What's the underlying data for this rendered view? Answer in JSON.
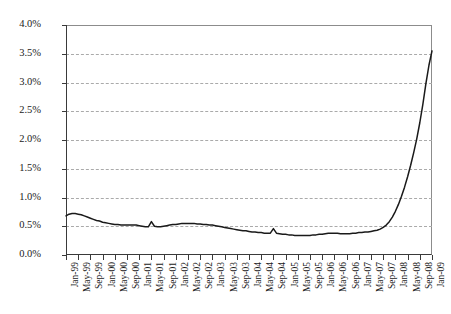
{
  "chart_data": {
    "type": "line",
    "title": "",
    "xlabel": "",
    "ylabel": "Percent Noncurrent (60+ days)",
    "ylim": [
      0,
      4.0
    ],
    "ytick_labels": [
      "0.0%",
      "0.5%",
      "1.0%",
      "1.5%",
      "2.0%",
      "2.5%",
      "3.0%",
      "3.5%",
      "4.0%"
    ],
    "ytick_values": [
      0.0,
      0.5,
      1.0,
      1.5,
      2.0,
      2.5,
      3.0,
      3.5,
      4.0
    ],
    "grid": true,
    "legend": "none",
    "units": "percent",
    "x_tick_labels": [
      "Jan-99",
      "May-99",
      "Sep-99",
      "Jan-00",
      "May-00",
      "Sep-00",
      "Jan-01",
      "May-01",
      "Sep-01",
      "Jan-02",
      "May-02",
      "Sep-02",
      "Jan-03",
      "May-03",
      "Sep-03",
      "Jan-04",
      "May-04",
      "Sep-04",
      "Jan-05",
      "May-05",
      "Sep-05",
      "Jan-06",
      "May-06",
      "Sep-06",
      "Jan-07",
      "May-07",
      "Sep-07",
      "Jan-08",
      "May-08",
      "Sep-08",
      "Jan-09"
    ],
    "x": [
      "Jan-99",
      "Feb-99",
      "Mar-99",
      "Apr-99",
      "May-99",
      "Jun-99",
      "Jul-99",
      "Aug-99",
      "Sep-99",
      "Oct-99",
      "Nov-99",
      "Dec-99",
      "Jan-00",
      "Feb-00",
      "Mar-00",
      "Apr-00",
      "May-00",
      "Jun-00",
      "Jul-00",
      "Aug-00",
      "Sep-00",
      "Oct-00",
      "Nov-00",
      "Dec-00",
      "Jan-01",
      "Feb-01",
      "Mar-01",
      "Apr-01",
      "May-01",
      "Jun-01",
      "Jul-01",
      "Aug-01",
      "Sep-01",
      "Oct-01",
      "Nov-01",
      "Dec-01",
      "Jan-02",
      "Feb-02",
      "Mar-02",
      "Apr-02",
      "May-02",
      "Jun-02",
      "Jul-02",
      "Aug-02",
      "Sep-02",
      "Oct-02",
      "Nov-02",
      "Dec-02",
      "Jan-03",
      "Feb-03",
      "Mar-03",
      "Apr-03",
      "May-03",
      "Jun-03",
      "Jul-03",
      "Aug-03",
      "Sep-03",
      "Oct-03",
      "Nov-03",
      "Dec-03",
      "Jan-04",
      "Feb-04",
      "Mar-04",
      "Apr-04",
      "May-04",
      "Jun-04",
      "Jul-04",
      "Aug-04",
      "Sep-04",
      "Oct-04",
      "Nov-04",
      "Dec-04",
      "Jan-05",
      "Feb-05",
      "Mar-05",
      "Apr-05",
      "May-05",
      "Jun-05",
      "Jul-05",
      "Aug-05",
      "Sep-05",
      "Oct-05",
      "Nov-05",
      "Dec-05",
      "Jan-06",
      "Feb-06",
      "Mar-06",
      "Apr-06",
      "May-06",
      "Jun-06",
      "Jul-06",
      "Aug-06",
      "Sep-06",
      "Oct-06",
      "Nov-06",
      "Dec-06",
      "Jan-07",
      "Feb-07",
      "Mar-07",
      "Apr-07",
      "May-07",
      "Jun-07",
      "Jul-07",
      "Aug-07",
      "Sep-07",
      "Oct-07",
      "Nov-07",
      "Dec-07",
      "Jan-08",
      "Feb-08",
      "Mar-08",
      "Apr-08",
      "May-08",
      "Jun-08",
      "Jul-08",
      "Aug-08",
      "Sep-08",
      "Oct-08",
      "Nov-08",
      "Dec-08",
      "Jan-09"
    ],
    "values": [
      0.68,
      0.71,
      0.72,
      0.72,
      0.71,
      0.7,
      0.68,
      0.66,
      0.64,
      0.62,
      0.6,
      0.59,
      0.57,
      0.56,
      0.55,
      0.54,
      0.53,
      0.53,
      0.52,
      0.52,
      0.52,
      0.52,
      0.52,
      0.52,
      0.51,
      0.5,
      0.49,
      0.49,
      0.58,
      0.5,
      0.49,
      0.49,
      0.5,
      0.51,
      0.52,
      0.53,
      0.53,
      0.54,
      0.55,
      0.55,
      0.55,
      0.55,
      0.55,
      0.54,
      0.54,
      0.53,
      0.53,
      0.52,
      0.52,
      0.51,
      0.5,
      0.49,
      0.48,
      0.47,
      0.46,
      0.45,
      0.44,
      0.43,
      0.42,
      0.42,
      0.41,
      0.4,
      0.4,
      0.39,
      0.39,
      0.38,
      0.38,
      0.38,
      0.46,
      0.38,
      0.37,
      0.36,
      0.36,
      0.35,
      0.35,
      0.34,
      0.34,
      0.34,
      0.34,
      0.34,
      0.34,
      0.35,
      0.35,
      0.36,
      0.36,
      0.37,
      0.38,
      0.38,
      0.38,
      0.38,
      0.37,
      0.37,
      0.37,
      0.37,
      0.38,
      0.38,
      0.39,
      0.39,
      0.4,
      0.4,
      0.41,
      0.42,
      0.43,
      0.45,
      0.48,
      0.52,
      0.58,
      0.66,
      0.76,
      0.88,
      1.02,
      1.18,
      1.36,
      1.56,
      1.78,
      2.02,
      2.3,
      2.62,
      2.98,
      3.3,
      3.55
    ]
  }
}
